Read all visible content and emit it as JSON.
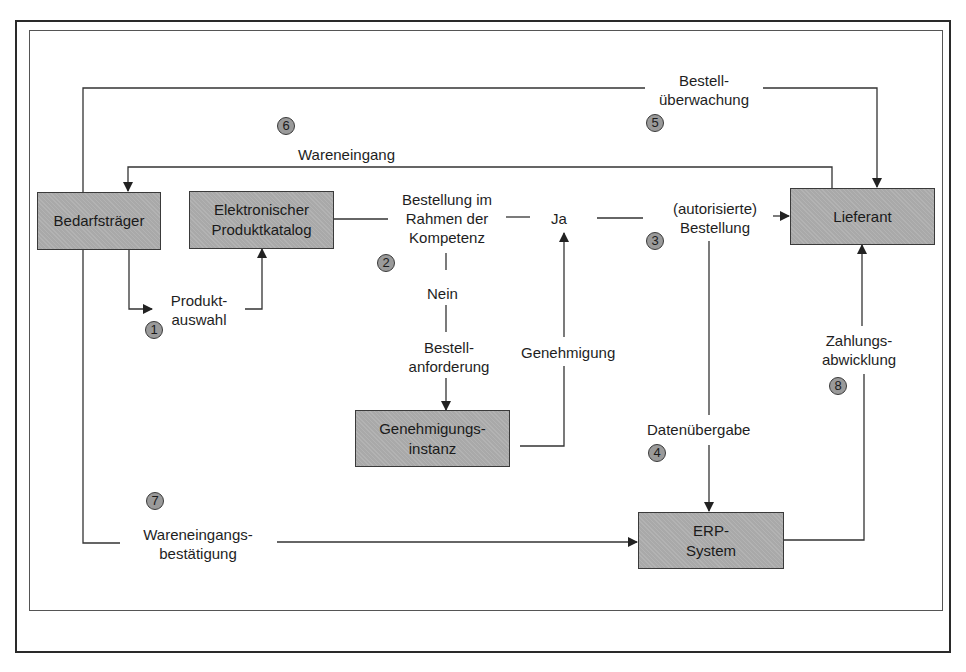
{
  "diagram": {
    "nodes": {
      "bedarfstraeger": "Bedarfsträger",
      "katalog": "Elektronischer Produktkatalog",
      "lieferant": "Lieferant",
      "genehmigungsinstanz": "Genehmigungs- instanz",
      "erp": "ERP- System"
    },
    "labels": {
      "bestellueberwachung_1": "Bestell-",
      "bestellueberwachung_2": "überwachung",
      "wareneingang": "Wareneingang",
      "bestellung_kompetenz_1": "Bestellung im",
      "bestellung_kompetenz_2": "Rahmen der",
      "bestellung_kompetenz_3": "Kompetenz",
      "ja": "Ja",
      "nein": "Nein",
      "autorisierte_1": "(autorisierte)",
      "autorisierte_2": "Bestellung",
      "produktauswahl_1": "Produkt-",
      "produktauswahl_2": "auswahl",
      "bestellanforderung_1": "Bestell-",
      "bestellanforderung_2": "anforderung",
      "genehmigung": "Genehmigung",
      "datenuebergabe": "Datenübergabe",
      "zahlungsabwicklung_1": "Zahlungs-",
      "zahlungsabwicklung_2": "abwicklung",
      "wareneingangsbestaetigung_1": "Wareneingangs-",
      "wareneingangsbestaetigung_2": "bestätigung"
    },
    "steps": {
      "s1": "1",
      "s2": "2",
      "s3": "3",
      "s4": "4",
      "s5": "5",
      "s6": "6",
      "s7": "7",
      "s8": "8"
    },
    "colors": {
      "box_fill": "#a9a9a9",
      "line": "#333333",
      "step_circle": "#9a9a9a"
    }
  }
}
